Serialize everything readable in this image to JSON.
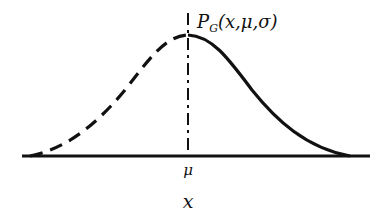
{
  "diagram": {
    "curve_label": "P_G(x,μ,σ)",
    "curve_label_main": "P",
    "curve_label_sub": "G",
    "curve_label_args": "(x,μ,σ)",
    "mean_tick_label": "μ",
    "x_axis_label": "x",
    "colors": {
      "stroke": "#111111",
      "background": "#ffffff"
    },
    "left_half_style": "dashed",
    "right_half_style": "solid",
    "mean_line_style": "dash-dot"
  }
}
